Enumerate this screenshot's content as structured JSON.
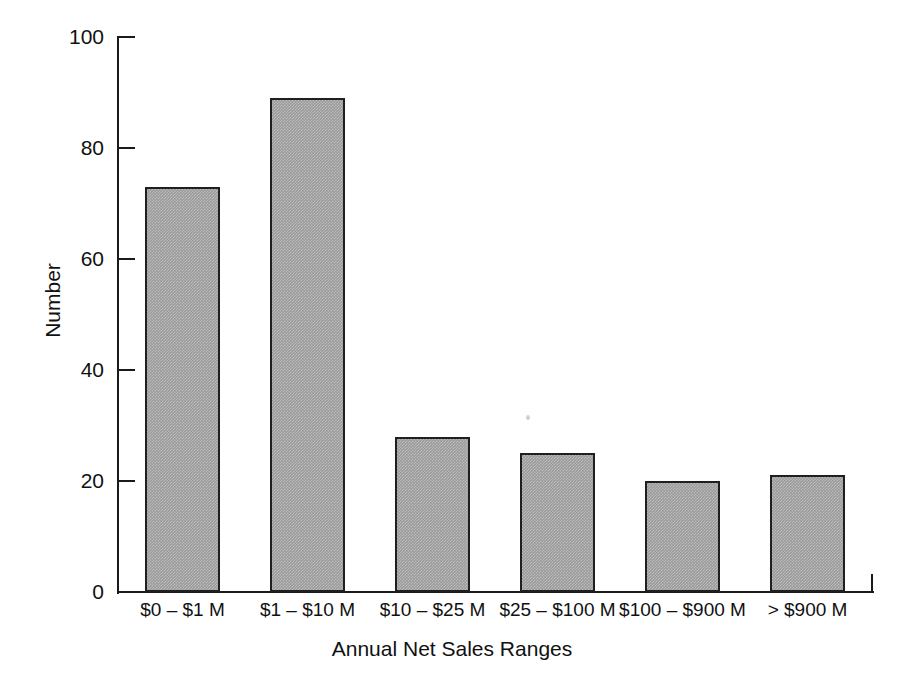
{
  "chart_data": {
    "type": "bar",
    "title": "",
    "subtitle": "",
    "xlabel": "Annual Net Sales Ranges",
    "ylabel": "Number",
    "categories": [
      "$0 – $1 M",
      "$1 – $10 M",
      "$10 – $25 M",
      "$25 – $100 M",
      "$100 – $900 M",
      "> $900 M"
    ],
    "values": [
      73,
      89,
      28,
      25,
      20,
      21
    ],
    "ylim": [
      0,
      100
    ],
    "yticks": [
      0,
      20,
      40,
      60,
      80,
      100
    ],
    "ytick_labels": [
      "0",
      "20",
      "40",
      "60",
      "80",
      "100"
    ],
    "grid": false,
    "legend": null,
    "bar_fill_color": "#9a9a9a",
    "bar_edge_color": "#1f1f1f",
    "axis_color": "#1a1a1a",
    "background_color": "#ffffff"
  }
}
